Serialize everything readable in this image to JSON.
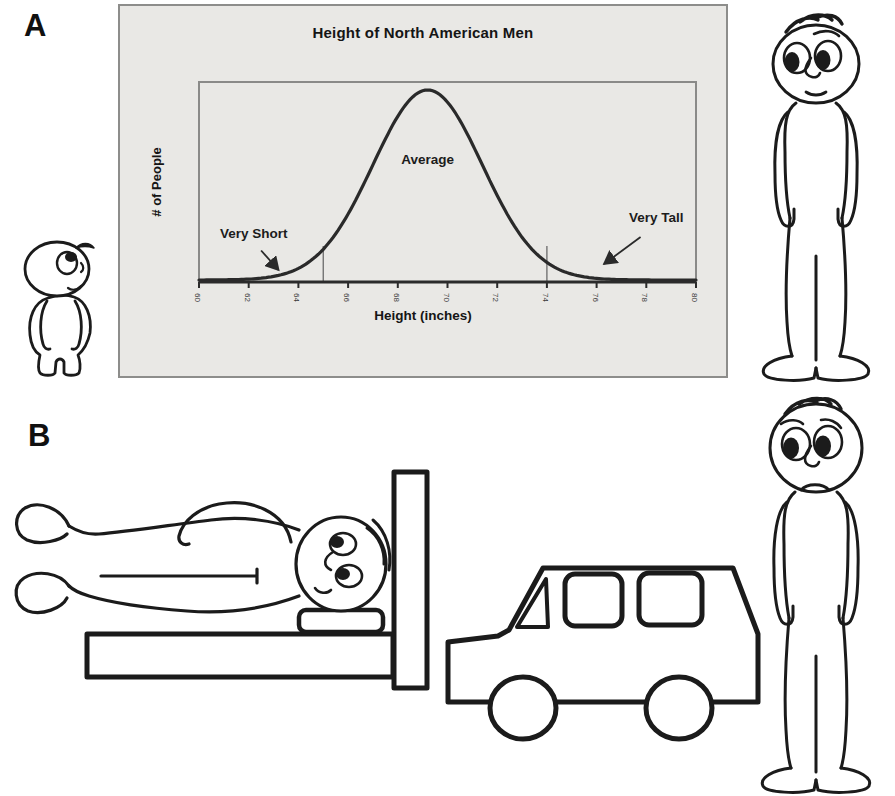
{
  "page": {
    "panel_a_label": "A",
    "panel_b_label": "B"
  },
  "chart_data": {
    "type": "line",
    "title": "Height of North American Men",
    "xlabel": "Height (inches)",
    "ylabel": "# of People",
    "xlim": [
      60,
      80
    ],
    "x_ticks": [
      60,
      62,
      64,
      66,
      68,
      70,
      72,
      74,
      76,
      78,
      80
    ],
    "x_tick_label_rotation_deg": 90,
    "ylim": [
      0,
      1
    ],
    "y_ticks": [],
    "grid": false,
    "legend": "none",
    "curve": {
      "distribution": "normal",
      "mean": 69.2,
      "sd": 2.2,
      "peak_height_frac": 0.95
    },
    "region_boundary_lines_x": [
      65,
      74
    ],
    "boundary_line_height_frac": 0.18,
    "annotations": [
      {
        "label": "Very Short",
        "x": 62.2,
        "y_frac": 0.22,
        "arrow_to": {
          "x": 63.2,
          "y_frac": 0.06
        }
      },
      {
        "label": "Average",
        "x": 69.2,
        "y_frac": 0.59
      },
      {
        "label": "Very Tall",
        "x": 78.4,
        "y_frac": 0.3,
        "arrow_to": {
          "x": 76.3,
          "y_frac": 0.09
        }
      }
    ],
    "colors": {
      "curve": "#2a2a2a",
      "axis": "#2b2b2b",
      "boundary_line": "#6a6a6a",
      "plot_border": "#8a8a88",
      "panel_bg": "#e9e8e5",
      "panel_border": "#8d8d8b",
      "text": "#1c1c1c",
      "tick_text": "#3a3a3a",
      "figure_stroke": "#1b1b1b"
    }
  },
  "figures": {
    "short_person": "short-person-figure",
    "tall_person_a": "tall-person-figure",
    "person_on_bed": "person-lying-on-short-bed-figure",
    "car": "car-figure",
    "tall_person_b": "sad-tall-person-figure"
  }
}
